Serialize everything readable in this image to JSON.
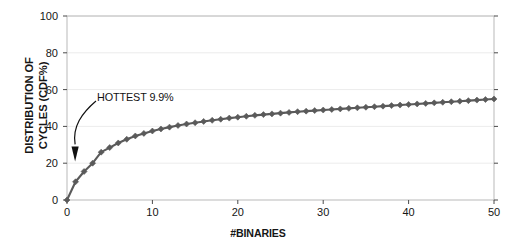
{
  "chart_data": {
    "type": "line",
    "title": "",
    "subtitle": "",
    "xlabel": "#BINARIES",
    "ylabel": "DISTRIBUTION OF CYCLES (CDF%)",
    "ylabel_line1": "DISTRIBUTION OF",
    "ylabel_line2": "CYCLES (CDF%)",
    "xlim": [
      0,
      50
    ],
    "ylim": [
      0,
      100
    ],
    "xticks": [
      0,
      10,
      20,
      30,
      40,
      50
    ],
    "yticks": [
      0,
      20,
      40,
      60,
      80,
      100
    ],
    "xtick_labels": [
      "0",
      "10",
      "20",
      "30",
      "40",
      "50"
    ],
    "ytick_labels": [
      "0",
      "20",
      "40",
      "60",
      "80",
      "100"
    ],
    "grid": "horizontal",
    "legend": "none",
    "marker": "diamond",
    "series_color": "#5a5a5a",
    "annotations": [
      {
        "text": "HOTTEST 9.9%",
        "x": 2.0,
        "y": 24,
        "arrow_to_x": 1.0,
        "arrow_to_y": 21
      }
    ],
    "series": [
      {
        "name": "cycles CDF",
        "x": [
          0,
          1,
          2,
          3,
          4,
          5,
          6,
          7,
          8,
          9,
          10,
          11,
          12,
          13,
          14,
          15,
          16,
          17,
          18,
          19,
          20,
          21,
          22,
          23,
          24,
          25,
          26,
          27,
          28,
          29,
          30,
          31,
          32,
          33,
          34,
          35,
          36,
          37,
          38,
          39,
          40,
          41,
          42,
          43,
          44,
          45,
          46,
          47,
          48,
          49,
          50
        ],
        "values": [
          0.0,
          9.9,
          15.5,
          20.0,
          26.0,
          28.5,
          31.0,
          33.0,
          34.8,
          36.2,
          37.5,
          38.6,
          39.6,
          40.5,
          41.3,
          42.0,
          42.7,
          43.3,
          43.9,
          44.5,
          45.0,
          45.5,
          46.0,
          46.4,
          46.8,
          47.2,
          47.6,
          48.0,
          48.3,
          48.6,
          48.9,
          49.2,
          49.5,
          49.8,
          50.1,
          50.4,
          50.7,
          51.0,
          51.3,
          51.6,
          51.9,
          52.2,
          52.5,
          52.8,
          53.1,
          53.4,
          53.7,
          54.0,
          54.3,
          54.6,
          54.9
        ]
      }
    ]
  },
  "axes": {
    "frame_color": "#b9b9b9",
    "grid_color": "#ececec",
    "text_color": "#161616"
  }
}
